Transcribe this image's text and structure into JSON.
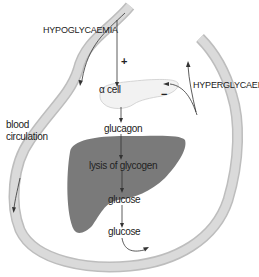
{
  "diagram": {
    "labels": {
      "hypoglycaemia": "HYPOGLYCAEMIA",
      "hyperglycaemia": "HYPERGLYCAEMIA",
      "blood_circulation_line1": "blood",
      "blood_circulation_line2": "circulation",
      "alpha_cell": "α cell",
      "glucagon": "glucagon",
      "lysis_of_glycogen": "lysis of glycogen",
      "glucose_liver": "glucose",
      "glucose_blood": "glucose",
      "plus_sign": "+",
      "minus_sign": "−"
    },
    "colors": {
      "vessel": "#d4d4d4",
      "vessel_edge": "#bdbdbd",
      "liver": "#7a7a7a",
      "alpha_cell_fill": "#f2f2f2",
      "arrow": "#333333",
      "text": "#222222"
    }
  }
}
